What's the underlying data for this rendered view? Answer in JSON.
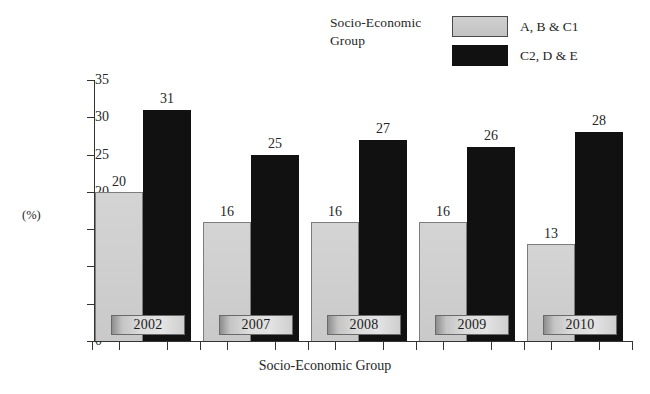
{
  "chart_data": {
    "type": "bar",
    "title": "",
    "xlabel": "Socio-Economic Group",
    "ylabel": "(%)",
    "ylim": [
      0,
      35
    ],
    "yticks": [
      0,
      5,
      10,
      15,
      20,
      25,
      30,
      35
    ],
    "ytick_labels": [
      "0",
      "5",
      "10",
      "15",
      "20",
      "25",
      "30",
      "35"
    ],
    "categories": [
      "2002",
      "2007",
      "2008",
      "2009",
      "2010"
    ],
    "grid": false,
    "legend_position": "top-right",
    "legend_title": "Socio-Economic Group",
    "series": [
      {
        "name": "A, B & C1",
        "color": "#cfcfcf",
        "values": [
          20,
          16,
          16,
          16,
          13
        ],
        "labels": [
          "20",
          "16",
          "16",
          "16",
          "13"
        ]
      },
      {
        "name": "C2, D & E",
        "color": "#111111",
        "values": [
          31,
          25,
          27,
          26,
          28
        ],
        "labels": [
          "31",
          "25",
          "27",
          "26",
          "28"
        ]
      }
    ]
  },
  "legend": {
    "title": "Socio-Economic Group",
    "entries": [
      {
        "label": "A, B & C1",
        "swatch": "light-gray-swatch"
      },
      {
        "label": "C2, D & E",
        "swatch": "black-swatch"
      }
    ]
  },
  "axes": {
    "y_axis_label": "(%)",
    "x_axis_label": "Socio-Economic Group"
  }
}
